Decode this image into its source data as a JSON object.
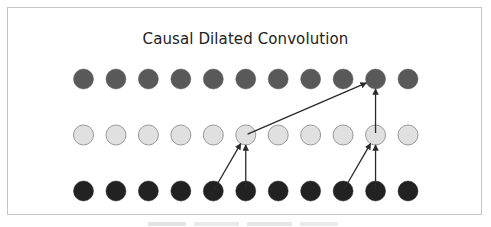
{
  "diagram": {
    "title": "Causal Dilated Convolution",
    "layers": [
      {
        "name": "output",
        "row": "top",
        "node_count": 11,
        "fill": "#595959",
        "stroke": "#595959",
        "cy": 79
      },
      {
        "name": "hidden",
        "row": "middle",
        "node_count": 11,
        "fill": "#e0e0e0",
        "stroke": "#9a9a9a",
        "cy": 135
      },
      {
        "name": "input",
        "row": "bottom",
        "node_count": 11,
        "fill": "#222222",
        "stroke": "#222222",
        "cy": 191
      }
    ],
    "node_radius": 10,
    "node_x_start": 83.5,
    "node_x_spacing": 32.45,
    "edges": [
      {
        "from": {
          "layer": "input",
          "index": 4
        },
        "to": {
          "layer": "hidden",
          "index": 5
        }
      },
      {
        "from": {
          "layer": "input",
          "index": 5
        },
        "to": {
          "layer": "hidden",
          "index": 5
        }
      },
      {
        "from": {
          "layer": "input",
          "index": 8
        },
        "to": {
          "layer": "hidden",
          "index": 9
        }
      },
      {
        "from": {
          "layer": "input",
          "index": 9
        },
        "to": {
          "layer": "hidden",
          "index": 9
        }
      },
      {
        "from": {
          "layer": "hidden",
          "index": 5
        },
        "to": {
          "layer": "output",
          "index": 9
        }
      },
      {
        "from": {
          "layer": "hidden",
          "index": 9
        },
        "to": {
          "layer": "output",
          "index": 9
        }
      }
    ],
    "edge_color": "#2a2a2a",
    "frame_border_color": "#c4c4c4"
  }
}
